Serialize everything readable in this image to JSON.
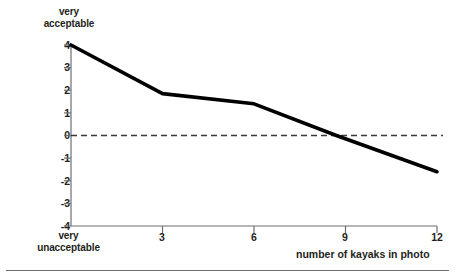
{
  "chart_data": {
    "type": "line",
    "title": "",
    "xlabel": "number of kayaks in photo",
    "ylabel": "",
    "y_top_cap_label": "very\nacceptable",
    "y_bottom_cap_label": "very\nunacceptable",
    "x": [
      0,
      3,
      6,
      8.7,
      12
    ],
    "values": [
      4,
      1.85,
      1.4,
      0,
      -1.6
    ],
    "series": [
      {
        "name": "acceptability rating",
        "x": [
          0,
          3,
          6,
          8.7,
          12
        ],
        "values": [
          4,
          1.85,
          1.4,
          0,
          -1.6
        ]
      }
    ],
    "xlim": [
      0,
      12
    ],
    "ylim": [
      -4,
      4
    ],
    "x_ticks": [
      3,
      6,
      9,
      12
    ],
    "x_tick_labels": [
      "3",
      "6",
      "9",
      "12"
    ],
    "y_ticks": [
      4,
      3,
      2,
      1,
      0,
      -1,
      -2,
      -3,
      -4
    ],
    "y_tick_labels": [
      "4",
      "3",
      "2",
      "1",
      "0",
      "-1",
      "-2",
      "-3",
      "-4"
    ],
    "grid": false,
    "legend": "none",
    "annotations": [
      {
        "name": "zero-reference-line",
        "type": "horizontal-dashed-line",
        "value": 0
      }
    ],
    "colors": {
      "line": "#000000",
      "axis": "#6d6e71",
      "text": "#231f20",
      "zero_line": "#4d4d4d",
      "background": "#ffffff"
    }
  },
  "axis": {
    "y_cap_top": "very\nacceptable",
    "y_cap_bottom": "very\nunacceptable",
    "x_title": "number of kayaks in photo"
  },
  "y_tick_labels": [
    "4",
    "3",
    "2",
    "1",
    "0",
    "-1",
    "-2",
    "-3",
    "-4"
  ],
  "x_tick_labels": [
    "3",
    "6",
    "9",
    "12"
  ]
}
